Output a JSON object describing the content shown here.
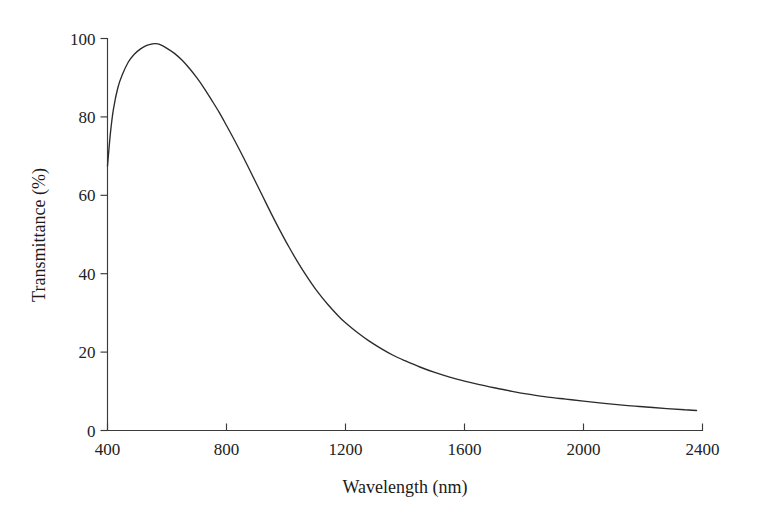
{
  "chart_data": {
    "type": "line",
    "title": "",
    "xlabel": "Wavelength (nm)",
    "ylabel": "Transmittance (%)",
    "xlim": [
      400,
      2400
    ],
    "ylim": [
      0,
      100
    ],
    "xticks": [
      400,
      800,
      1200,
      1600,
      2000,
      2400
    ],
    "xtick_labels": [
      "400",
      "800",
      "1200",
      "1600",
      "2000",
      "2400"
    ],
    "yticks": [
      0,
      20,
      40,
      60,
      80,
      100
    ],
    "ytick_labels": [
      "0",
      "20",
      "40",
      "60",
      "80",
      "100"
    ],
    "grid": false,
    "legend": null,
    "series": [
      {
        "name": "Transmittance",
        "color": "#2b2b2b",
        "x": [
          400,
          410,
          420,
          435,
          450,
          470,
          490,
          510,
          530,
          550,
          561,
          575,
          600,
          625,
          650,
          675,
          700,
          725,
          750,
          775,
          800,
          830,
          860,
          890,
          920,
          950,
          980,
          1010,
          1040,
          1070,
          1100,
          1140,
          1180,
          1200,
          1240,
          1280,
          1320,
          1360,
          1400,
          1450,
          1500,
          1550,
          1600,
          1650,
          1700,
          1760,
          1820,
          1880,
          1940,
          2000,
          2070,
          2140,
          2210,
          2280,
          2340,
          2380
        ],
        "y": [
          67.5,
          76.0,
          82.0,
          87.5,
          90.8,
          94.0,
          96.0,
          97.3,
          98.2,
          98.6,
          98.7,
          98.5,
          97.5,
          96.2,
          94.5,
          92.4,
          90.0,
          87.3,
          84.3,
          81.2,
          77.8,
          73.6,
          69.2,
          64.6,
          60.0,
          55.4,
          51.0,
          46.8,
          42.9,
          39.3,
          36.0,
          32.2,
          28.9,
          27.5,
          25.0,
          22.8,
          20.9,
          19.2,
          17.8,
          16.2,
          14.8,
          13.6,
          12.6,
          11.7,
          10.9,
          10.0,
          9.2,
          8.5,
          8.0,
          7.5,
          6.9,
          6.4,
          6.0,
          5.6,
          5.3,
          5.1
        ]
      }
    ]
  },
  "axes": {
    "x_axis_name": "wavelength-axis",
    "y_axis_name": "transmittance-axis"
  }
}
